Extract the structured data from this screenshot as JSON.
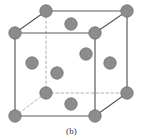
{
  "figure": {
    "caption": "(b)",
    "canvas": {
      "width": 143,
      "height": 140
    },
    "colors": {
      "background": "#ffffff",
      "atom_fill": "#8c8c8c",
      "atom_stroke": "#6f6f6f",
      "edge_solid": "#5a5a5a",
      "edge_hidden": "#b0b0b0",
      "caption_text": "#3b3b3b"
    },
    "geometry": {
      "atom_radius": 6.2,
      "edge_width": 1.2,
      "hidden_edge_width": 1.0,
      "hidden_edge_dash": "2.5,2.5"
    },
    "vertices": [
      {
        "name": "front-bottom-left",
        "x": 15,
        "y": 116
      },
      {
        "name": "front-bottom-right",
        "x": 95,
        "y": 116
      },
      {
        "name": "front-top-right",
        "x": 95,
        "y": 33
      },
      {
        "name": "front-top-left",
        "x": 15,
        "y": 33
      },
      {
        "name": "back-bottom-left",
        "x": 46,
        "y": 93
      },
      {
        "name": "back-bottom-right",
        "x": 127,
        "y": 93
      },
      {
        "name": "back-top-right",
        "x": 127,
        "y": 11
      },
      {
        "name": "back-top-left",
        "x": 46,
        "y": 11
      }
    ],
    "edges": [
      {
        "name": "front-bottom",
        "from": "front-bottom-left",
        "to": "front-bottom-right",
        "hidden": false
      },
      {
        "name": "front-right",
        "from": "front-bottom-right",
        "to": "front-top-right",
        "hidden": false
      },
      {
        "name": "front-top",
        "from": "front-top-right",
        "to": "front-top-left",
        "hidden": false
      },
      {
        "name": "front-left",
        "from": "front-top-left",
        "to": "front-bottom-left",
        "hidden": false
      },
      {
        "name": "back-top",
        "from": "back-top-left",
        "to": "back-top-right",
        "hidden": false
      },
      {
        "name": "back-right",
        "from": "back-top-right",
        "to": "back-bottom-right",
        "hidden": false
      },
      {
        "name": "back-bottom",
        "from": "back-bottom-left",
        "to": "back-bottom-right",
        "hidden": true
      },
      {
        "name": "back-left",
        "from": "back-top-left",
        "to": "back-bottom-left",
        "hidden": true
      },
      {
        "name": "depth-top-left",
        "from": "front-top-left",
        "to": "back-top-left",
        "hidden": false
      },
      {
        "name": "depth-top-right",
        "from": "front-top-right",
        "to": "back-top-right",
        "hidden": false
      },
      {
        "name": "depth-bottom-right",
        "from": "front-bottom-right",
        "to": "back-bottom-right",
        "hidden": false
      },
      {
        "name": "depth-bottom-left",
        "from": "front-bottom-left",
        "to": "back-bottom-left",
        "hidden": true
      }
    ],
    "atoms": [
      {
        "name": "corner-front-bottom-left",
        "type": "corner",
        "x": 15,
        "y": 116
      },
      {
        "name": "corner-front-bottom-right",
        "type": "corner",
        "x": 95,
        "y": 116
      },
      {
        "name": "corner-front-top-right",
        "type": "corner",
        "x": 95,
        "y": 33
      },
      {
        "name": "corner-front-top-left",
        "type": "corner",
        "x": 15,
        "y": 33
      },
      {
        "name": "corner-back-bottom-left",
        "type": "corner",
        "x": 46,
        "y": 93
      },
      {
        "name": "corner-back-bottom-right",
        "type": "corner",
        "x": 127,
        "y": 93
      },
      {
        "name": "corner-back-top-right",
        "type": "corner",
        "x": 127,
        "y": 11
      },
      {
        "name": "corner-back-top-left",
        "type": "corner",
        "x": 46,
        "y": 11
      },
      {
        "name": "face-center-top",
        "type": "face-center",
        "x": 71,
        "y": 24
      },
      {
        "name": "face-center-bottom",
        "type": "face-center",
        "x": 71,
        "y": 104
      },
      {
        "name": "face-center-left",
        "type": "face-center",
        "x": 32,
        "y": 63
      },
      {
        "name": "face-center-right",
        "type": "face-center",
        "x": 110,
        "y": 63
      },
      {
        "name": "face-center-front",
        "type": "face-center",
        "x": 86,
        "y": 54
      },
      {
        "name": "face-center-back",
        "type": "face-center",
        "x": 57,
        "y": 73
      }
    ]
  }
}
